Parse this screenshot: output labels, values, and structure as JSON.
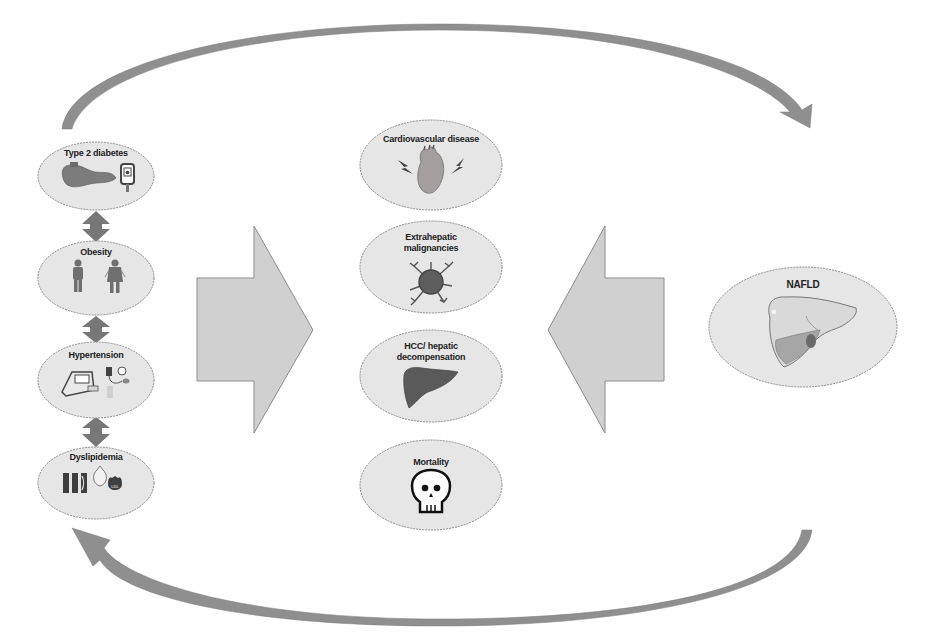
{
  "diagram": {
    "colors": {
      "ellipse_fill": "#e6e6e6",
      "ellipse_stroke": "#8a8a8a",
      "block_arrow_fill": "#d0d0d0",
      "block_arrow_stroke": "#8c8c8c",
      "curved_arrow_fill": "#8f8f8f",
      "double_arrow_fill": "#777777",
      "icon_dark": "#4a4a4a"
    },
    "risk_factors": [
      {
        "label": "Type 2 diabetes"
      },
      {
        "label": "Obesity"
      },
      {
        "label": "Hypertension"
      },
      {
        "label": "Dyslipidemia"
      }
    ],
    "outcomes": [
      {
        "label_line1": "Cardiovascular disease",
        "label_line2": ""
      },
      {
        "label_line1": "Extrahepatic",
        "label_line2": "malignancies"
      },
      {
        "label_line1": "HCC/ hepatic",
        "label_line2": "decompensation"
      },
      {
        "label_line1": "Mortality",
        "label_line2": ""
      }
    ],
    "nafld": {
      "label": "NAFLD"
    },
    "dyslipidemia_badge": "LDL"
  }
}
